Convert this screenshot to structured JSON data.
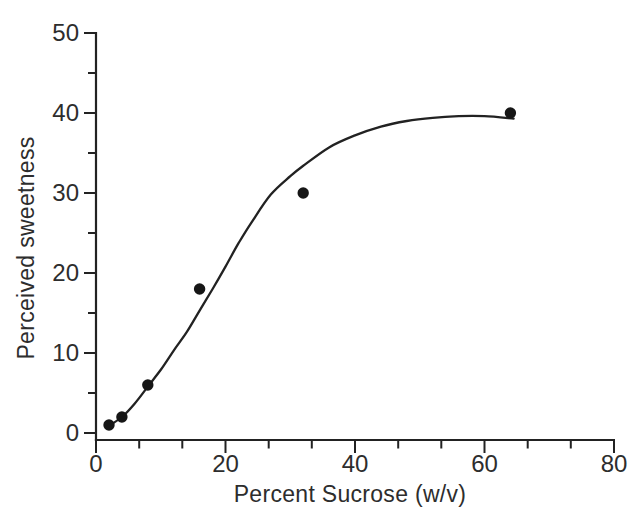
{
  "figure": {
    "background": "#ffffff",
    "ink_color": "#222222",
    "text_color": "#2d2d2d",
    "marker_color": "#161616"
  },
  "chart_data": {
    "type": "scatter",
    "title": "",
    "xlabel": "Percent Sucrose (w/v)",
    "ylabel": "Perceived sweetness",
    "xlim": [
      0,
      80
    ],
    "ylim": [
      0,
      50
    ],
    "grid": false,
    "legend": "none",
    "x_major_ticks": [
      0,
      20,
      40,
      60,
      80
    ],
    "x_minor_ticks": [
      6.67,
      13.33,
      26.67,
      33.33,
      46.67,
      53.33,
      66.67,
      73.33
    ],
    "y_major_ticks": [
      0,
      10,
      20,
      30,
      40,
      50
    ],
    "y_minor_ticks": [
      5,
      15,
      25,
      35,
      45
    ],
    "x": [
      2,
      4,
      8,
      16,
      32,
      64
    ],
    "y": [
      1,
      2,
      6,
      18,
      30,
      40
    ],
    "marker": "filled-circle",
    "fit_curve_samples": [
      [
        1.8,
        0.8
      ],
      [
        4,
        2.0
      ],
      [
        6,
        3.7
      ],
      [
        8,
        5.8
      ],
      [
        10,
        7.9
      ],
      [
        12,
        10.3
      ],
      [
        14,
        12.6
      ],
      [
        16,
        15.3
      ],
      [
        18,
        18.0
      ],
      [
        20,
        20.8
      ],
      [
        22,
        23.7
      ],
      [
        24,
        26.3
      ],
      [
        27,
        29.8
      ],
      [
        30,
        32.1
      ],
      [
        32,
        33.4
      ],
      [
        36,
        35.7
      ],
      [
        40,
        37.2
      ],
      [
        44,
        38.3
      ],
      [
        48,
        39.0
      ],
      [
        52,
        39.4
      ],
      [
        56,
        39.6
      ],
      [
        60,
        39.6
      ],
      [
        64.5,
        39.3
      ]
    ]
  }
}
